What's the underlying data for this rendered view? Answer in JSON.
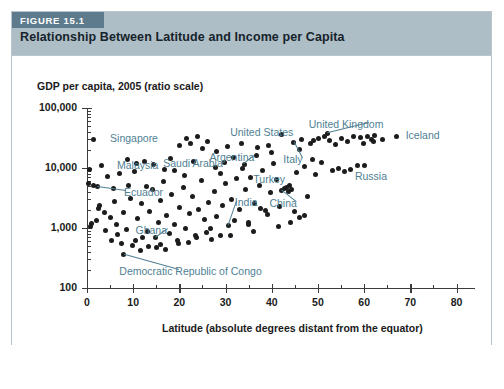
{
  "figure": {
    "badge": "FIGURE 15.1",
    "title": "Relationship Between Latitude and Income per Capita"
  },
  "colors": {
    "header_band": "#aebec7",
    "badge_band": "#5d7b8c",
    "label_text": "#4f7f93",
    "point": "#1c1c1c",
    "axis": "#3b3b3b",
    "card_border": "#b9c4cb"
  },
  "chart_data": {
    "type": "scatter",
    "title": "Relationship Between Latitude and Income per Capita",
    "xlabel": "Latitude (absolute degrees distant from the equator)",
    "ylabel": "GDP per capita, 2005 (ratio scale)",
    "yscale": "log",
    "xlim": [
      0,
      84
    ],
    "ylim": [
      100,
      100000
    ],
    "grid": false,
    "legend": "none",
    "xticks": [
      0,
      10,
      20,
      30,
      40,
      50,
      60,
      70,
      80
    ],
    "xticklabels": [
      "0",
      "10",
      "20",
      "30",
      "40",
      "50",
      "60",
      "70",
      "80"
    ],
    "xminorticks": [
      5,
      15,
      25,
      35,
      45,
      55,
      65,
      75
    ],
    "yticks": [
      100,
      1000,
      10000,
      100000
    ],
    "yticklabels": [
      "100",
      "1,000",
      "10,000",
      "100,000"
    ],
    "points": [
      {
        "x": 1.3,
        "y": 30000,
        "label": "Singapore"
      },
      {
        "x": 3.2,
        "y": 11000,
        "label": "Malaysia"
      },
      {
        "x": 2.0,
        "y": 1350
      },
      {
        "x": 1.0,
        "y": 1200
      },
      {
        "x": 0.8,
        "y": 1050
      },
      {
        "x": 0.4,
        "y": 5500
      },
      {
        "x": 1.5,
        "y": 5100
      },
      {
        "x": 2.2,
        "y": 4900,
        "label": "Ecuador"
      },
      {
        "x": 0.6,
        "y": 9600
      },
      {
        "x": 2.8,
        "y": 2400
      },
      {
        "x": 4.0,
        "y": 900
      },
      {
        "x": 5.2,
        "y": 620
      },
      {
        "x": 6.3,
        "y": 1150
      },
      {
        "x": 4.4,
        "y": 7200
      },
      {
        "x": 5.8,
        "y": 4500
      },
      {
        "x": 7.1,
        "y": 8000
      },
      {
        "x": 6.0,
        "y": 2800
      },
      {
        "x": 7.8,
        "y": 1800
      },
      {
        "x": 8.5,
        "y": 960
      },
      {
        "x": 9.4,
        "y": 3100
      },
      {
        "x": 10.2,
        "y": 8800
      },
      {
        "x": 9.0,
        "y": 5200
      },
      {
        "x": 8.0,
        "y": 360,
        "label": "Democratic Republic of Congo"
      },
      {
        "x": 11.0,
        "y": 1450
      },
      {
        "x": 10.5,
        "y": 620
      },
      {
        "x": 12.0,
        "y": 690
      },
      {
        "x": 11.8,
        "y": 2600
      },
      {
        "x": 12.8,
        "y": 5000
      },
      {
        "x": 13.6,
        "y": 1900
      },
      {
        "x": 13.0,
        "y": 880
      },
      {
        "x": 14.2,
        "y": 4300
      },
      {
        "x": 14.8,
        "y": 700,
        "label": "Ghana"
      },
      {
        "x": 15.4,
        "y": 1250
      },
      {
        "x": 15.9,
        "y": 2900
      },
      {
        "x": 16.5,
        "y": 6000
      },
      {
        "x": 17.2,
        "y": 1600
      },
      {
        "x": 16.0,
        "y": 530
      },
      {
        "x": 17.8,
        "y": 820
      },
      {
        "x": 18.4,
        "y": 3600
      },
      {
        "x": 18.9,
        "y": 1150
      },
      {
        "x": 19.5,
        "y": 620
      },
      {
        "x": 20.1,
        "y": 2200
      },
      {
        "x": 20.8,
        "y": 4700
      },
      {
        "x": 21.4,
        "y": 1000
      },
      {
        "x": 19.0,
        "y": 9000
      },
      {
        "x": 21.0,
        "y": 7500
      },
      {
        "x": 22.2,
        "y": 1750
      },
      {
        "x": 22.9,
        "y": 3300
      },
      {
        "x": 23.5,
        "y": 760
      },
      {
        "x": 24.2,
        "y": 2050
      },
      {
        "x": 23.0,
        "y": 13000
      },
      {
        "x": 24.8,
        "y": 6200
      },
      {
        "x": 25.5,
        "y": 1400
      },
      {
        "x": 25.0,
        "y": 21000,
        "label": "Saudi Arabia"
      },
      {
        "x": 26.2,
        "y": 2700
      },
      {
        "x": 26.8,
        "y": 980
      },
      {
        "x": 27.5,
        "y": 4100
      },
      {
        "x": 28.1,
        "y": 1550
      },
      {
        "x": 28.8,
        "y": 8200
      },
      {
        "x": 29.4,
        "y": 2350
      },
      {
        "x": 30.0,
        "y": 5600
      },
      {
        "x": 30.6,
        "y": 1100,
        "label": "India"
      },
      {
        "x": 31.2,
        "y": 3000
      },
      {
        "x": 31.8,
        "y": 15000
      },
      {
        "x": 32.4,
        "y": 6800
      },
      {
        "x": 33.0,
        "y": 2000
      },
      {
        "x": 33.7,
        "y": 9800
      },
      {
        "x": 34.3,
        "y": 4400
      },
      {
        "x": 34.9,
        "y": 1250
      },
      {
        "x": 35.5,
        "y": 7000
      },
      {
        "x": 34.0,
        "y": 11500,
        "label": "Argentina"
      },
      {
        "x": 36.2,
        "y": 2600
      },
      {
        "x": 36.8,
        "y": 16000
      },
      {
        "x": 37.4,
        "y": 5200
      },
      {
        "x": 38.0,
        "y": 9000,
        "label": "Turkey"
      },
      {
        "x": 38.6,
        "y": 1950
      },
      {
        "x": 39.2,
        "y": 24000
      },
      {
        "x": 39.8,
        "y": 3900
      },
      {
        "x": 40.4,
        "y": 12000
      },
      {
        "x": 41.0,
        "y": 6500
      },
      {
        "x": 41.6,
        "y": 2300
      },
      {
        "x": 42.2,
        "y": 4200,
        "label": "China"
      },
      {
        "x": 42.8,
        "y": 4500
      },
      {
        "x": 43.2,
        "y": 4700
      },
      {
        "x": 43.6,
        "y": 4000
      },
      {
        "x": 43.9,
        "y": 5100
      },
      {
        "x": 44.3,
        "y": 4300
      },
      {
        "x": 44.8,
        "y": 27000,
        "label": "Italy"
      },
      {
        "x": 45.4,
        "y": 8500
      },
      {
        "x": 45.9,
        "y": 1500
      },
      {
        "x": 46.5,
        "y": 30000
      },
      {
        "x": 47.1,
        "y": 10500
      },
      {
        "x": 47.7,
        "y": 3400
      },
      {
        "x": 42.0,
        "y": 36000,
        "label": "United States"
      },
      {
        "x": 48.3,
        "y": 26000
      },
      {
        "x": 48.9,
        "y": 14000
      },
      {
        "x": 49.5,
        "y": 7800
      },
      {
        "x": 50.1,
        "y": 31000
      },
      {
        "x": 50.8,
        "y": 12500
      },
      {
        "x": 51.4,
        "y": 33000
      },
      {
        "x": 52.0,
        "y": 38000,
        "label": "United Kingdom"
      },
      {
        "x": 52.6,
        "y": 29000
      },
      {
        "x": 53.2,
        "y": 9200
      },
      {
        "x": 53.8,
        "y": 25000
      },
      {
        "x": 54.5,
        "y": 10000
      },
      {
        "x": 55.1,
        "y": 31000
      },
      {
        "x": 55.8,
        "y": 8600
      },
      {
        "x": 56.4,
        "y": 28000
      },
      {
        "x": 57.0,
        "y": 9500
      },
      {
        "x": 57.8,
        "y": 34000
      },
      {
        "x": 58.5,
        "y": 10800
      },
      {
        "x": 59.2,
        "y": 32000
      },
      {
        "x": 60.0,
        "y": 11000,
        "label": "Russia"
      },
      {
        "x": 60.8,
        "y": 33500
      },
      {
        "x": 61.5,
        "y": 29500
      },
      {
        "x": 62.3,
        "y": 35000
      },
      {
        "x": 64.0,
        "y": 30000
      },
      {
        "x": 67.0,
        "y": 34000,
        "label": "Iceland"
      },
      {
        "x": 59.8,
        "y": 26000
      },
      {
        "x": 62.0,
        "y": 27500
      },
      {
        "x": 49.0,
        "y": 29000
      },
      {
        "x": 46.0,
        "y": 20000
      },
      {
        "x": 40.0,
        "y": 18000
      },
      {
        "x": 37.0,
        "y": 22000
      },
      {
        "x": 33.5,
        "y": 26000
      },
      {
        "x": 30.5,
        "y": 23000
      },
      {
        "x": 28.0,
        "y": 19000
      },
      {
        "x": 26.0,
        "y": 28000
      },
      {
        "x": 22.5,
        "y": 26000
      },
      {
        "x": 20.0,
        "y": 24000
      },
      {
        "x": 18.0,
        "y": 14500
      },
      {
        "x": 24.0,
        "y": 33000
      },
      {
        "x": 21.5,
        "y": 31000
      },
      {
        "x": 35.0,
        "y": 1150
      },
      {
        "x": 37.5,
        "y": 2100
      },
      {
        "x": 39.0,
        "y": 1700
      },
      {
        "x": 32.0,
        "y": 1350
      },
      {
        "x": 29.0,
        "y": 760
      },
      {
        "x": 27.0,
        "y": 640
      },
      {
        "x": 25.8,
        "y": 850
      },
      {
        "x": 23.8,
        "y": 690
      },
      {
        "x": 22.0,
        "y": 580
      },
      {
        "x": 19.8,
        "y": 560
      },
      {
        "x": 17.0,
        "y": 430
      },
      {
        "x": 15.0,
        "y": 480
      },
      {
        "x": 13.4,
        "y": 500
      },
      {
        "x": 11.5,
        "y": 420
      },
      {
        "x": 9.8,
        "y": 520
      },
      {
        "x": 7.5,
        "y": 560
      },
      {
        "x": 6.5,
        "y": 780
      },
      {
        "x": 5.0,
        "y": 1500
      },
      {
        "x": 3.8,
        "y": 1800
      },
      {
        "x": 2.5,
        "y": 2100
      },
      {
        "x": 45.0,
        "y": 1900
      },
      {
        "x": 47.0,
        "y": 1600
      },
      {
        "x": 44.0,
        "y": 1250
      },
      {
        "x": 41.5,
        "y": 1050
      },
      {
        "x": 36.0,
        "y": 890
      },
      {
        "x": 31.0,
        "y": 740
      },
      {
        "x": 16.8,
        "y": 9500
      },
      {
        "x": 14.5,
        "y": 11500
      },
      {
        "x": 12.5,
        "y": 13000
      },
      {
        "x": 10.8,
        "y": 12000
      },
      {
        "x": 8.8,
        "y": 14000
      },
      {
        "x": 27.8,
        "y": 10200
      },
      {
        "x": 29.8,
        "y": 12500
      }
    ],
    "annotations": [
      {
        "text": "Singapore",
        "point_x": 1.3,
        "point_y": 30000,
        "label_x": 5.0,
        "label_y": 30000,
        "leader": false
      },
      {
        "text": "Malaysia",
        "point_x": 3.2,
        "point_y": 11000,
        "label_x": 6.5,
        "label_y": 11000,
        "leader": false
      },
      {
        "text": "Ecuador",
        "point_x": 2.2,
        "point_y": 4900,
        "label_x": 8.0,
        "label_y": 3900,
        "leader": true
      },
      {
        "text": "Ghana",
        "point_x": 14.8,
        "point_y": 700,
        "label_x": 10.5,
        "label_y": 900,
        "leader": true
      },
      {
        "text": "Saudi Arabia",
        "point_x": 25.0,
        "point_y": 21000,
        "label_x": 16.5,
        "label_y": 11500,
        "leader": false
      },
      {
        "text": "Argentina",
        "point_x": 34.0,
        "point_y": 11500,
        "label_x": 26.5,
        "label_y": 14500,
        "leader": true
      },
      {
        "text": "India",
        "point_x": 30.6,
        "point_y": 1100,
        "label_x": 32.0,
        "label_y": 2600,
        "leader": true
      },
      {
        "text": "Turkey",
        "point_x": 38.0,
        "point_y": 9000,
        "label_x": 36.0,
        "label_y": 6200,
        "leader": false
      },
      {
        "text": "China",
        "point_x": 42.2,
        "point_y": 4200,
        "label_x": 39.5,
        "label_y": 2500,
        "leader": true
      },
      {
        "text": "Italy",
        "point_x": 44.8,
        "point_y": 27000,
        "label_x": 42.5,
        "label_y": 13500,
        "leader": true
      },
      {
        "text": "United States",
        "point_x": 42.0,
        "point_y": 36000,
        "label_x": 31.0,
        "label_y": 38000,
        "leader": false
      },
      {
        "text": "United Kingdom",
        "point_x": 52.0,
        "point_y": 38000,
        "label_x": 48.0,
        "label_y": 52000,
        "leader": true
      },
      {
        "text": "Iceland",
        "point_x": 67.0,
        "point_y": 34000,
        "label_x": 69.0,
        "label_y": 34000,
        "leader": false
      },
      {
        "text": "Russia",
        "point_x": 60.0,
        "point_y": 11000,
        "label_x": 58.0,
        "label_y": 7000,
        "leader": false
      },
      {
        "text": "Democratic Republic of Congo",
        "point_x": 8.0,
        "point_y": 360,
        "label_x": 7.0,
        "label_y": 185,
        "leader": true
      }
    ]
  }
}
